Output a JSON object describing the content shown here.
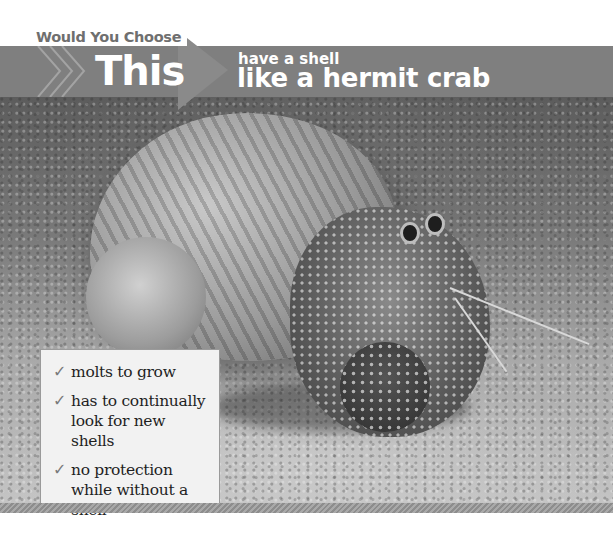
{
  "header": {
    "kicker": "Would You Choose",
    "choice_label": "This",
    "subtitle_small": "have a shell",
    "subtitle_big": "like a hermit crab"
  },
  "photo": {
    "subject": "hermit crab in shell on sand",
    "style": "grayscale"
  },
  "facts_box": {
    "items": [
      {
        "icon": "check-icon",
        "glyph": "✓",
        "text": "molts to grow"
      },
      {
        "icon": "check-icon",
        "glyph": "✓",
        "text": "has to continually look for new shells"
      },
      {
        "icon": "check-icon",
        "glyph": "✓",
        "text": "no protection while without a shell"
      }
    ]
  },
  "colors": {
    "band": "#7f7f7f",
    "arrow": "#8a8a8a",
    "kicker_text": "#6f6f6f",
    "box_bg": "#f2f2f2",
    "check": "#7a7a7a"
  }
}
